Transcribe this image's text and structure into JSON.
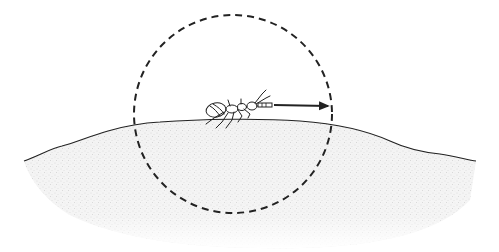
{
  "illustration": {
    "description": "Insect (ant-like) standing on a mound of speckled ground, enclosed by a dashed circle, with an arrow pointing from the insect's antennae to the circle's edge",
    "elements": {
      "ground": "speckled-soil-mound",
      "insect": "ant-like-insect",
      "circle": "dashed-range-circle",
      "arrow": "radius-arrow"
    },
    "colors": {
      "line": "#222222",
      "ground_fill": "#e6e6e6",
      "background": "#ffffff"
    }
  }
}
